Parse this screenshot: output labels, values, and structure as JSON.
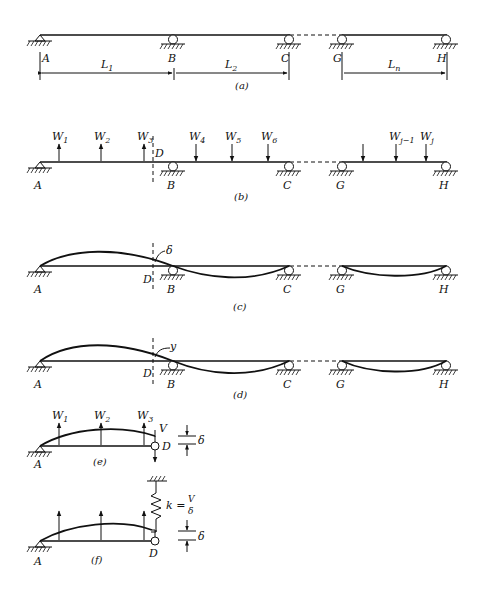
{
  "figure": {
    "panels": [
      {
        "id": "a",
        "caption": "(a)",
        "description": "Continuous beam with supports and span lengths"
      },
      {
        "id": "b",
        "caption": "(b)",
        "description": "Beam with applied loads and cut section D"
      },
      {
        "id": "c",
        "caption": "(c)",
        "description": "Deflected shape with displacement delta at D"
      },
      {
        "id": "d",
        "caption": "(d)",
        "description": "Deflected shape with displacement y at D"
      },
      {
        "id": "e",
        "caption": "(e)",
        "description": "Free body of cut segment A-D with shear V"
      },
      {
        "id": "f",
        "caption": "(f)",
        "description": "Segment A-D with spring of stiffness k = V/delta"
      }
    ],
    "supports": {
      "A": "A",
      "B": "B",
      "C": "C",
      "G": "G",
      "H": "H"
    },
    "point_D": "D",
    "spans": {
      "L1": "L",
      "L1_sub": "1",
      "L2": "L",
      "L2_sub": "2",
      "Ln": "L",
      "Ln_sub": "n"
    },
    "loads": {
      "W1": {
        "base": "W",
        "sub": "1"
      },
      "W2": {
        "base": "W",
        "sub": "2"
      },
      "W3": {
        "base": "W",
        "sub": "3"
      },
      "W4": {
        "base": "W",
        "sub": "4"
      },
      "W5": {
        "base": "W",
        "sub": "5"
      },
      "W6": {
        "base": "W",
        "sub": "6"
      },
      "Wj1": {
        "base": "W",
        "sub": "j−1"
      },
      "Wj": {
        "base": "W",
        "sub": "j"
      }
    },
    "symbols": {
      "delta": "δ",
      "y": "y",
      "V": "V",
      "k_eq": "k =",
      "k_num": "V",
      "k_den": "δ"
    }
  }
}
